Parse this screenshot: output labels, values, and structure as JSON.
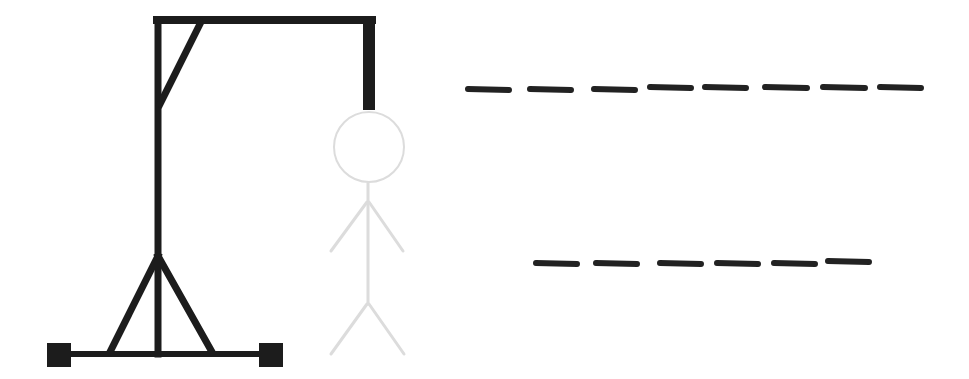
{
  "game": {
    "type": "hangman",
    "wrong_guesses_shown": 0,
    "figure_state": "outline-only",
    "colors": {
      "gallows": "#1c1c1c",
      "figure_outline": "#dcdcdc",
      "blanks": "#222222",
      "background": "#ffffff"
    }
  },
  "gallows": {
    "parts": [
      "base",
      "left-foot",
      "right-foot",
      "left-leg",
      "right-leg",
      "post",
      "beam",
      "brace",
      "rope"
    ]
  },
  "figure": {
    "parts": [
      "head",
      "body",
      "left-arm",
      "right-arm",
      "left-leg",
      "right-leg"
    ]
  },
  "puzzle": {
    "words": [
      {
        "length": 8,
        "letters": [
          "",
          "",
          "",
          "",
          "",
          "",
          "",
          ""
        ]
      },
      {
        "length": 6,
        "letters": [
          "",
          "",
          "",
          "",
          "",
          ""
        ]
      }
    ]
  }
}
